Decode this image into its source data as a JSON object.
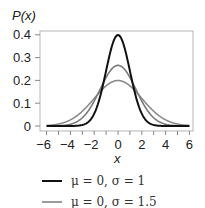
{
  "chart_data": {
    "type": "line",
    "title": "",
    "xlabel": "x",
    "ylabel": "P(x)",
    "xlim": [
      -6,
      6
    ],
    "ylim": [
      0,
      0.4
    ],
    "x_ticks": [
      -6,
      -4,
      -2,
      0,
      2,
      4,
      6
    ],
    "x_tick_labels": [
      "−6",
      "−4",
      "−2",
      "0",
      "2",
      "4",
      "6"
    ],
    "x_minor_ticks": [
      -6,
      -5,
      -4,
      -3,
      -2,
      -1,
      0,
      1,
      2,
      3,
      4,
      5,
      6
    ],
    "y_ticks": [
      0,
      0.1,
      0.2,
      0.3,
      0.4
    ],
    "y_tick_labels": [
      "0",
      "0.1",
      "0.2",
      "0.3",
      "0.4"
    ],
    "grid": false,
    "legend_position": "below",
    "series": [
      {
        "name": "μ = 0, σ = 1",
        "mu": 0,
        "sigma": 1,
        "color": "#111111",
        "width": 2.0,
        "peak": 0.399,
        "x": [
          -6,
          -4,
          -3,
          -2,
          -1,
          0,
          1,
          2,
          3,
          4,
          6
        ],
        "values": [
          0.0,
          0.0001,
          0.0044,
          0.054,
          0.242,
          0.399,
          0.242,
          0.054,
          0.0044,
          0.0001,
          0.0
        ]
      },
      {
        "name": "μ = 0, σ = 1.5",
        "mu": 0,
        "sigma": 1.5,
        "color": "#7a7a7a",
        "width": 1.6,
        "peak": 0.266,
        "x": [
          -6,
          -4,
          -3,
          -2,
          -1,
          0,
          1,
          2,
          3,
          4,
          6
        ],
        "values": [
          0.0001,
          0.0076,
          0.036,
          0.109,
          0.213,
          0.266,
          0.213,
          0.109,
          0.036,
          0.0076,
          0.0001
        ]
      },
      {
        "name": "μ = 0, σ = 2",
        "mu": 0,
        "sigma": 2,
        "color": "#8c8c8c",
        "width": 1.6,
        "peak": 0.199,
        "x": [
          -6,
          -4,
          -3,
          -2,
          -1,
          0,
          1,
          2,
          3,
          4,
          6
        ],
        "values": [
          0.0022,
          0.027,
          0.065,
          0.121,
          0.176,
          0.199,
          0.176,
          0.121,
          0.065,
          0.027,
          0.0022
        ]
      }
    ]
  },
  "legend": {
    "items": [
      {
        "label": "μ = 0, σ = 1",
        "color": "#111111"
      },
      {
        "label": "μ = 0, σ = 1.5",
        "color": "#7a7a7a"
      }
    ]
  }
}
